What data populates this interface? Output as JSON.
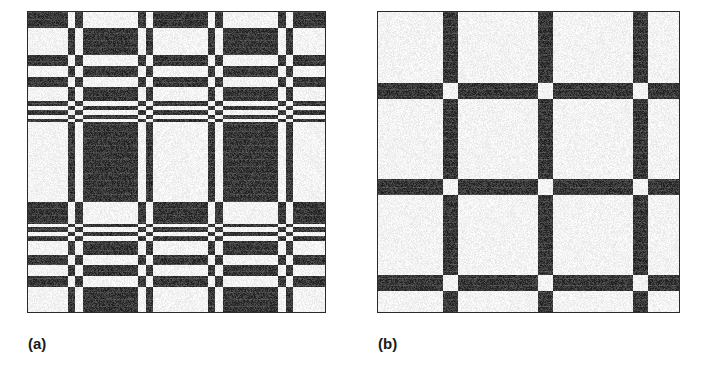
{
  "figure": {
    "type": "binary-texture-pair",
    "background_color": "#ffffff",
    "ink_color": "#1a1a1a",
    "panels": [
      {
        "id": "a",
        "caption": "(a)",
        "description": "high-frequency symmetric binary plaid texture with fine sub-stripes",
        "width_px": 299,
        "height_px": 302,
        "border_color": "#2a2a2a",
        "pattern": {
          "kind": "separable-plaid",
          "rule": "black where row_code XOR col_code equals 0",
          "invert": false,
          "col_code": [
            1,
            1,
            1,
            1,
            1,
            1,
            1,
            1,
            1,
            1,
            1,
            1,
            1,
            1,
            1,
            1,
            1,
            1,
            1,
            1,
            1,
            1,
            1,
            1,
            1,
            1,
            1,
            1,
            1,
            1,
            1,
            1,
            1,
            1,
            1,
            1,
            1,
            1,
            1,
            1,
            0,
            0,
            0,
            0,
            0,
            0,
            0,
            1,
            1,
            1,
            1,
            1,
            1,
            1,
            1,
            0,
            0,
            0,
            0,
            0,
            0,
            0,
            0,
            0,
            0,
            0,
            0,
            0,
            0,
            0,
            0,
            0,
            0,
            0,
            0,
            0,
            0,
            0,
            0,
            0,
            0,
            0,
            0,
            0,
            0,
            0,
            0,
            0,
            0,
            0,
            0,
            0,
            0,
            0,
            0,
            0,
            0,
            0,
            0,
            0,
            0,
            0,
            0,
            0,
            0,
            0,
            0,
            0,
            0,
            0,
            1,
            1,
            1,
            1,
            1,
            1,
            1,
            1,
            0,
            0,
            0,
            0,
            0,
            0,
            0,
            1,
            1,
            1,
            1,
            1,
            1,
            1,
            1,
            1,
            1,
            1,
            1,
            1,
            1,
            1,
            1,
            1,
            1,
            1,
            1,
            1,
            1,
            1,
            1,
            1,
            1,
            1,
            1,
            1,
            1,
            1,
            1,
            1,
            1,
            1,
            1,
            1,
            1,
            1,
            1,
            1,
            1,
            1,
            1,
            1,
            1,
            1,
            1,
            1,
            1,
            1,
            1,
            1,
            1,
            1,
            0,
            0,
            0,
            0,
            0,
            0,
            0,
            1,
            1,
            1,
            1,
            1,
            1,
            1,
            1,
            0,
            0,
            0,
            0,
            0,
            0,
            0,
            0,
            0,
            0,
            0,
            0,
            0,
            0,
            0,
            0,
            0,
            0,
            0,
            0,
            0,
            0,
            0,
            0,
            0,
            0,
            0,
            0,
            0,
            0,
            0,
            0,
            0,
            0,
            0,
            0,
            0,
            0,
            0,
            0,
            0,
            0,
            0,
            0,
            0,
            0,
            0,
            0,
            0,
            0,
            0,
            0,
            0,
            0,
            0,
            1,
            1,
            1,
            1,
            1,
            1,
            1,
            1,
            0,
            0,
            0,
            0,
            0,
            0,
            0,
            1,
            1,
            1,
            1,
            1,
            1,
            1,
            1,
            1,
            1,
            1,
            1,
            1,
            1,
            1,
            1,
            1,
            1,
            1,
            1,
            1,
            1,
            1,
            1,
            1
          ],
          "row_code": [
            1,
            1,
            1,
            1,
            1,
            1,
            1,
            1,
            1,
            1,
            1,
            1,
            1,
            1,
            1,
            1,
            0,
            0,
            0,
            0,
            0,
            0,
            0,
            0,
            0,
            0,
            0,
            0,
            0,
            0,
            0,
            0,
            0,
            0,
            0,
            0,
            0,
            0,
            0,
            0,
            0,
            0,
            0,
            1,
            1,
            1,
            1,
            1,
            1,
            1,
            1,
            1,
            1,
            1,
            0,
            0,
            0,
            0,
            0,
            0,
            0,
            0,
            0,
            0,
            0,
            1,
            1,
            1,
            1,
            1,
            1,
            1,
            1,
            1,
            1,
            0,
            0,
            0,
            0,
            0,
            0,
            0,
            0,
            0,
            0,
            0,
            0,
            0,
            0,
            1,
            1,
            1,
            1,
            1,
            0,
            0,
            0,
            0,
            1,
            1,
            1,
            1,
            1,
            0,
            0,
            0,
            0,
            1,
            1,
            1,
            0,
            0,
            0,
            0,
            0,
            0,
            0,
            0,
            0,
            0,
            0,
            0,
            0,
            0,
            0,
            0,
            0,
            0,
            0,
            0,
            0,
            0,
            0,
            0,
            0,
            0,
            0,
            0,
            0,
            0,
            0,
            0,
            0,
            0,
            0,
            0,
            0,
            0,
            0,
            0,
            0,
            0,
            0,
            0,
            0,
            0,
            0,
            0,
            0,
            0,
            0,
            0,
            0,
            0,
            0,
            0,
            0,
            0,
            0,
            0,
            0,
            0,
            0,
            0,
            0,
            0,
            0,
            0,
            0,
            0,
            0,
            0,
            0,
            0,
            0,
            0,
            0,
            0,
            0,
            0,
            1,
            1,
            1,
            1,
            1,
            1,
            1,
            1,
            1,
            1,
            1,
            1,
            1,
            1,
            1,
            1,
            1,
            1,
            1,
            1,
            1,
            1,
            0,
            0,
            0,
            1,
            1,
            1,
            1,
            1,
            0,
            0,
            0,
            0,
            1,
            1,
            1,
            1,
            1,
            0,
            0,
            0,
            0,
            0,
            0,
            0,
            0,
            0,
            0,
            0,
            0,
            0,
            0,
            1,
            1,
            1,
            1,
            1,
            1,
            1,
            1,
            1,
            1,
            0,
            0,
            0,
            0,
            0,
            0,
            0,
            0,
            0,
            0,
            0,
            1,
            1,
            1,
            1,
            1,
            1,
            1,
            1,
            1,
            1,
            1,
            0,
            0,
            0,
            0,
            0,
            0,
            0,
            0,
            0,
            0,
            0,
            0,
            0,
            0,
            0,
            0,
            0,
            0,
            0,
            0,
            0,
            0,
            0,
            0,
            0,
            0,
            0,
            1,
            1,
            1,
            1,
            1,
            1,
            1,
            1,
            1,
            1,
            1,
            1,
            1,
            1,
            1,
            1
          ]
        }
      },
      {
        "id": "b",
        "caption": "(b)",
        "description": "low-frequency binary plaid / checkerboard texture with thick bands",
        "width_px": 303,
        "height_px": 302,
        "border_color": "#2a2a2a",
        "pattern": {
          "kind": "separable-plaid",
          "rule": "black where row_code XOR col_code equals 0",
          "invert": true,
          "col_code": [
            1,
            1,
            1,
            1,
            1,
            1,
            1,
            1,
            1,
            1,
            1,
            1,
            1,
            1,
            1,
            1,
            1,
            1,
            1,
            1,
            1,
            1,
            1,
            1,
            1,
            1,
            1,
            1,
            1,
            1,
            1,
            1,
            1,
            1,
            1,
            1,
            1,
            1,
            1,
            1,
            1,
            1,
            1,
            1,
            1,
            1,
            1,
            1,
            1,
            1,
            1,
            1,
            1,
            1,
            1,
            1,
            1,
            1,
            1,
            1,
            1,
            1,
            1,
            1,
            1,
            0,
            0,
            0,
            0,
            0,
            0,
            0,
            0,
            0,
            0,
            0,
            0,
            0,
            0,
            0,
            1,
            1,
            1,
            1,
            1,
            1,
            1,
            1,
            1,
            1,
            1,
            1,
            1,
            1,
            1,
            1,
            1,
            1,
            1,
            1,
            1,
            1,
            1,
            1,
            1,
            1,
            1,
            1,
            1,
            1,
            1,
            1,
            1,
            1,
            1,
            1,
            1,
            1,
            1,
            1,
            1,
            1,
            1,
            1,
            1,
            1,
            1,
            1,
            1,
            1,
            1,
            1,
            1,
            1,
            1,
            1,
            1,
            1,
            1,
            1,
            1,
            1,
            1,
            1,
            1,
            1,
            1,
            1,
            1,
            1,
            1,
            1,
            1,
            1,
            1,
            1,
            1,
            1,
            1,
            1,
            0,
            0,
            0,
            0,
            0,
            0,
            0,
            0,
            0,
            0,
            0,
            0,
            0,
            0,
            0,
            1,
            1,
            1,
            1,
            1,
            1,
            1,
            1,
            1,
            1,
            1,
            1,
            1,
            1,
            1,
            1,
            1,
            1,
            1,
            1,
            1,
            1,
            1,
            1,
            1,
            1,
            1,
            1,
            1,
            1,
            1,
            1,
            1,
            1,
            1,
            1,
            1,
            1,
            1,
            1,
            1,
            1,
            1,
            1,
            1,
            1,
            1,
            1,
            1,
            1,
            1,
            1,
            1,
            1,
            1,
            1,
            1,
            1,
            1,
            1,
            1,
            1,
            1,
            1,
            1,
            1,
            1,
            1,
            1,
            1,
            1,
            1,
            1,
            1,
            1,
            1,
            1,
            1,
            1,
            1,
            0,
            0,
            0,
            0,
            0,
            0,
            0,
            0,
            0,
            0,
            0,
            0,
            0,
            0,
            0,
            1,
            1,
            1,
            1,
            1,
            1,
            1,
            1,
            1,
            1,
            1,
            1,
            1,
            1,
            1,
            1,
            1,
            1,
            1,
            1,
            1,
            1,
            1,
            1,
            1,
            1,
            1,
            1,
            1,
            1,
            1,
            1,
            1,
            1,
            1,
            1,
            1,
            1
          ],
          "row_code": [
            1,
            1,
            1,
            1,
            1,
            1,
            1,
            1,
            1,
            1,
            1,
            1,
            1,
            1,
            1,
            1,
            1,
            1,
            1,
            1,
            1,
            1,
            1,
            1,
            1,
            1,
            1,
            1,
            1,
            1,
            1,
            1,
            1,
            1,
            1,
            1,
            1,
            1,
            1,
            1,
            1,
            1,
            1,
            1,
            1,
            1,
            1,
            1,
            1,
            1,
            1,
            1,
            1,
            1,
            1,
            1,
            1,
            1,
            1,
            1,
            1,
            1,
            1,
            1,
            1,
            1,
            1,
            1,
            1,
            1,
            1,
            0,
            0,
            0,
            0,
            0,
            0,
            0,
            0,
            0,
            0,
            0,
            0,
            0,
            0,
            0,
            0,
            1,
            1,
            1,
            1,
            1,
            1,
            1,
            1,
            1,
            1,
            1,
            1,
            1,
            1,
            1,
            1,
            1,
            1,
            1,
            1,
            1,
            1,
            1,
            1,
            1,
            1,
            1,
            1,
            1,
            1,
            1,
            1,
            1,
            1,
            1,
            1,
            1,
            1,
            1,
            1,
            1,
            1,
            1,
            1,
            1,
            1,
            1,
            1,
            1,
            1,
            1,
            1,
            1,
            1,
            1,
            1,
            1,
            1,
            1,
            1,
            1,
            1,
            1,
            1,
            1,
            1,
            1,
            1,
            1,
            1,
            1,
            1,
            1,
            1,
            1,
            1,
            1,
            1,
            1,
            1,
            0,
            0,
            0,
            0,
            0,
            0,
            0,
            0,
            0,
            0,
            0,
            0,
            0,
            0,
            0,
            0,
            1,
            1,
            1,
            1,
            1,
            1,
            1,
            1,
            1,
            1,
            1,
            1,
            1,
            1,
            1,
            1,
            1,
            1,
            1,
            1,
            1,
            1,
            1,
            1,
            1,
            1,
            1,
            1,
            1,
            1,
            1,
            1,
            1,
            1,
            1,
            1,
            1,
            1,
            1,
            1,
            1,
            1,
            1,
            1,
            1,
            1,
            1,
            1,
            1,
            1,
            1,
            1,
            1,
            1,
            1,
            1,
            1,
            1,
            1,
            1,
            1,
            1,
            1,
            1,
            1,
            1,
            1,
            1,
            1,
            1,
            1,
            1,
            1,
            1,
            1,
            1,
            1,
            1,
            1,
            1,
            0,
            0,
            0,
            0,
            0,
            0,
            0,
            0,
            0,
            0,
            0,
            0,
            0,
            0,
            0,
            0,
            1,
            1,
            1,
            1,
            1,
            1,
            1,
            1,
            1,
            1,
            1,
            1,
            1,
            1,
            1,
            1,
            1,
            1,
            1,
            1,
            1,
            1,
            1,
            1,
            1,
            1,
            1,
            1,
            1,
            1,
            1,
            1,
            1,
            1,
            1,
            1,
            1,
            1,
            1
          ]
        }
      }
    ]
  }
}
